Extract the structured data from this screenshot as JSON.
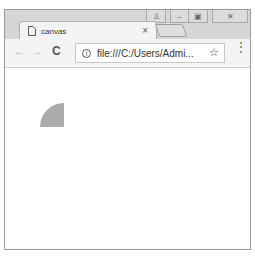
{
  "window": {
    "caption_buttons": [
      {
        "name": "user",
        "glyph": "♙"
      },
      {
        "name": "minimize",
        "glyph": "–"
      },
      {
        "name": "maximize",
        "glyph": "▣"
      },
      {
        "name": "close",
        "glyph": "✕"
      }
    ]
  },
  "tab": {
    "icon": "page-icon",
    "title": "canvas",
    "close_glyph": "×"
  },
  "toolbar": {
    "back_glyph": "←",
    "forward_glyph": "→",
    "reload_glyph": "C",
    "info_glyph": "i",
    "url": "file:///C:/Users/Admi...",
    "star_glyph": "☆",
    "menu_glyph": "⋮"
  },
  "canvas": {
    "shape": "quarter-circle",
    "fill": "#ababab",
    "radius": 24
  }
}
